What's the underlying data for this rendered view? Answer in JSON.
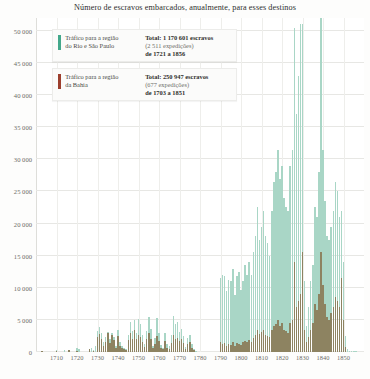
{
  "chart_data": {
    "type": "bar",
    "title": "Número de escravos embarcados, anualmente, para esses destinos",
    "xlabel": "",
    "ylabel": "",
    "ylim": [
      0,
      52000
    ],
    "xlim": [
      1700,
      1860
    ],
    "grid": true,
    "legend_position": "top-left",
    "ytick_labels": [
      "0",
      "5 000",
      "10 000",
      "15 000",
      "20 000",
      "25 000",
      "30 000",
      "35 000",
      "40 000",
      "45 000",
      "50 000"
    ],
    "ytick_values": [
      0,
      5000,
      10000,
      15000,
      20000,
      25000,
      30000,
      35000,
      40000,
      45000,
      50000
    ],
    "xtick_labels": [
      "1710",
      "1720",
      "1730",
      "1740",
      "1750",
      "1760",
      "1770",
      "1780",
      "1790",
      "1800",
      "1810",
      "1820",
      "1830",
      "1840",
      "1850"
    ],
    "xtick_values": [
      1710,
      1720,
      1730,
      1740,
      1750,
      1760,
      1770,
      1780,
      1790,
      1800,
      1810,
      1820,
      1830,
      1840,
      1850
    ],
    "series": [
      {
        "name": "Tráfico para a região do Rio e São Paulo",
        "color": "#a9d6c6",
        "legend_color": "#43a88b",
        "points": [
          [
            1710,
            350
          ],
          [
            1711,
            0
          ],
          [
            1712,
            0
          ],
          [
            1713,
            0
          ],
          [
            1714,
            300
          ],
          [
            1715,
            0
          ],
          [
            1716,
            0
          ],
          [
            1717,
            0
          ],
          [
            1718,
            0
          ],
          [
            1719,
            0
          ],
          [
            1720,
            650
          ],
          [
            1721,
            400
          ],
          [
            1722,
            0
          ],
          [
            1723,
            0
          ],
          [
            1724,
            0
          ],
          [
            1725,
            0
          ],
          [
            1726,
            0
          ],
          [
            1727,
            700
          ],
          [
            1728,
            250
          ],
          [
            1729,
            900
          ],
          [
            1730,
            3200
          ],
          [
            1731,
            3900
          ],
          [
            1732,
            3000
          ],
          [
            1733,
            1500
          ],
          [
            1734,
            2400
          ],
          [
            1735,
            3100
          ],
          [
            1736,
            2000
          ],
          [
            1737,
            3000
          ],
          [
            1738,
            2400
          ],
          [
            1739,
            1000
          ],
          [
            1740,
            3400
          ],
          [
            1741,
            1500
          ],
          [
            1742,
            900
          ],
          [
            1743,
            700
          ],
          [
            1744,
            500
          ],
          [
            1745,
            2700
          ],
          [
            1746,
            4600
          ],
          [
            1747,
            3200
          ],
          [
            1748,
            5000
          ],
          [
            1749,
            2900
          ],
          [
            1750,
            5100
          ],
          [
            1751,
            4400
          ],
          [
            1752,
            2600
          ],
          [
            1753,
            1300
          ],
          [
            1754,
            3300
          ],
          [
            1755,
            5500
          ],
          [
            1756,
            3600
          ],
          [
            1757,
            900
          ],
          [
            1758,
            2200
          ],
          [
            1759,
            5300
          ],
          [
            1760,
            3000
          ],
          [
            1761,
            1100
          ],
          [
            1762,
            600
          ],
          [
            1763,
            3000
          ],
          [
            1764,
            1200
          ],
          [
            1765,
            900
          ],
          [
            1766,
            2600
          ],
          [
            1767,
            5600
          ],
          [
            1768,
            4300
          ],
          [
            1769,
            4700
          ],
          [
            1770,
            3100
          ],
          [
            1771,
            3600
          ],
          [
            1772,
            2500
          ],
          [
            1773,
            800
          ],
          [
            1774,
            2200
          ],
          [
            1775,
            2700
          ],
          [
            1776,
            1200
          ],
          [
            1777,
            400
          ],
          [
            1778,
            200
          ],
          [
            1779,
            0
          ],
          [
            1780,
            0
          ],
          [
            1781,
            0
          ],
          [
            1782,
            0
          ],
          [
            1783,
            0
          ],
          [
            1784,
            0
          ],
          [
            1785,
            0
          ],
          [
            1786,
            0
          ],
          [
            1787,
            0
          ],
          [
            1788,
            0
          ],
          [
            1789,
            0
          ],
          [
            1790,
            11500
          ],
          [
            1791,
            12000
          ],
          [
            1792,
            11800
          ],
          [
            1793,
            9500
          ],
          [
            1794,
            11200
          ],
          [
            1795,
            11000
          ],
          [
            1796,
            13000
          ],
          [
            1797,
            8800
          ],
          [
            1798,
            11800
          ],
          [
            1799,
            12500
          ],
          [
            1800,
            9700
          ],
          [
            1801,
            11000
          ],
          [
            1802,
            13500
          ],
          [
            1803,
            12000
          ],
          [
            1804,
            14000
          ],
          [
            1805,
            12000
          ],
          [
            1806,
            15500
          ],
          [
            1807,
            18000
          ],
          [
            1808,
            22500
          ],
          [
            1809,
            17500
          ],
          [
            1810,
            19500
          ],
          [
            1811,
            22000
          ],
          [
            1812,
            18000
          ],
          [
            1813,
            17000
          ],
          [
            1814,
            15000
          ],
          [
            1815,
            22000
          ],
          [
            1816,
            26500
          ],
          [
            1817,
            28000
          ],
          [
            1818,
            31500
          ],
          [
            1819,
            27000
          ],
          [
            1820,
            29000
          ],
          [
            1821,
            24000
          ],
          [
            1822,
            22500
          ],
          [
            1823,
            22000
          ],
          [
            1824,
            29000
          ],
          [
            1825,
            31500
          ],
          [
            1826,
            50500
          ],
          [
            1827,
            37000
          ],
          [
            1828,
            43000
          ],
          [
            1829,
            51000
          ],
          [
            1830,
            51000
          ],
          [
            1831,
            11000
          ],
          [
            1832,
            4000
          ],
          [
            1833,
            7000
          ],
          [
            1834,
            11000
          ],
          [
            1835,
            13500
          ],
          [
            1836,
            22500
          ],
          [
            1837,
            21000
          ],
          [
            1838,
            28000
          ],
          [
            1839,
            52000
          ],
          [
            1840,
            31500
          ],
          [
            1841,
            23500
          ],
          [
            1842,
            18000
          ],
          [
            1843,
            17500
          ],
          [
            1844,
            19500
          ],
          [
            1845,
            22000
          ],
          [
            1846,
            26500
          ],
          [
            1847,
            25000
          ],
          [
            1848,
            21000
          ],
          [
            1849,
            22000
          ],
          [
            1850,
            14000
          ],
          [
            1851,
            2500
          ],
          [
            1852,
            400
          ],
          [
            1853,
            200
          ],
          [
            1854,
            150
          ],
          [
            1855,
            100
          ],
          [
            1856,
            80
          ]
        ],
        "total_slaves": "1 170 601",
        "expeditions": "2 511",
        "range": "de 1721 a 1856"
      },
      {
        "name": "Tráfico para a região da Bahia",
        "color": "#8d8361",
        "legend_color": "#9c3f2d",
        "points": [
          [
            1703,
            100
          ],
          [
            1710,
            200
          ],
          [
            1716,
            300
          ],
          [
            1720,
            150
          ],
          [
            1726,
            400
          ],
          [
            1728,
            200
          ],
          [
            1730,
            2300
          ],
          [
            1731,
            2800
          ],
          [
            1732,
            2000
          ],
          [
            1733,
            900
          ],
          [
            1734,
            1600
          ],
          [
            1735,
            2900
          ],
          [
            1736,
            1400
          ],
          [
            1737,
            2600
          ],
          [
            1738,
            1800
          ],
          [
            1739,
            700
          ],
          [
            1740,
            2500
          ],
          [
            1741,
            1000
          ],
          [
            1742,
            600
          ],
          [
            1743,
            500
          ],
          [
            1744,
            300
          ],
          [
            1745,
            1800
          ],
          [
            1746,
            3000
          ],
          [
            1747,
            2100
          ],
          [
            1748,
            3400
          ],
          [
            1749,
            2000
          ],
          [
            1750,
            2700
          ],
          [
            1751,
            2300
          ],
          [
            1752,
            1500
          ],
          [
            1753,
            800
          ],
          [
            1754,
            2000
          ],
          [
            1755,
            3000
          ],
          [
            1756,
            2100
          ],
          [
            1757,
            600
          ],
          [
            1758,
            1300
          ],
          [
            1759,
            2500
          ],
          [
            1760,
            1700
          ],
          [
            1761,
            700
          ],
          [
            1762,
            400
          ],
          [
            1763,
            1700
          ],
          [
            1764,
            700
          ],
          [
            1765,
            500
          ],
          [
            1766,
            1400
          ],
          [
            1767,
            2600
          ],
          [
            1768,
            2100
          ],
          [
            1769,
            2200
          ],
          [
            1770,
            1700
          ],
          [
            1771,
            2000
          ],
          [
            1772,
            1400
          ],
          [
            1773,
            500
          ],
          [
            1774,
            1200
          ],
          [
            1775,
            1500
          ],
          [
            1776,
            700
          ],
          [
            1777,
            250
          ],
          [
            1790,
            1500
          ],
          [
            1791,
            1200
          ],
          [
            1792,
            1400
          ],
          [
            1793,
            900
          ],
          [
            1794,
            1300
          ],
          [
            1795,
            1100
          ],
          [
            1796,
            1500
          ],
          [
            1797,
            900
          ],
          [
            1798,
            1400
          ],
          [
            1799,
            1300
          ],
          [
            1800,
            1100
          ],
          [
            1801,
            1500
          ],
          [
            1802,
            1700
          ],
          [
            1803,
            1500
          ],
          [
            1804,
            1900
          ],
          [
            1805,
            1500
          ],
          [
            1806,
            2200
          ],
          [
            1807,
            2700
          ],
          [
            1808,
            3500
          ],
          [
            1809,
            2800
          ],
          [
            1810,
            3100
          ],
          [
            1811,
            3400
          ],
          [
            1812,
            2700
          ],
          [
            1813,
            2500
          ],
          [
            1814,
            2300
          ],
          [
            1815,
            3400
          ],
          [
            1816,
            4000
          ],
          [
            1817,
            4300
          ],
          [
            1818,
            5000
          ],
          [
            1819,
            4000
          ],
          [
            1820,
            4500
          ],
          [
            1821,
            3500
          ],
          [
            1822,
            3300
          ],
          [
            1823,
            3000
          ],
          [
            1824,
            4500
          ],
          [
            1825,
            5000
          ],
          [
            1826,
            14000
          ],
          [
            1827,
            7000
          ],
          [
            1828,
            8000
          ],
          [
            1829,
            9000
          ],
          [
            1830,
            15500
          ],
          [
            1831,
            3500
          ],
          [
            1832,
            1500
          ],
          [
            1833,
            2300
          ],
          [
            1834,
            3500
          ],
          [
            1835,
            4500
          ],
          [
            1836,
            7500
          ],
          [
            1837,
            6500
          ],
          [
            1838,
            9000
          ],
          [
            1839,
            15500
          ],
          [
            1840,
            10500
          ],
          [
            1841,
            7500
          ],
          [
            1842,
            5500
          ],
          [
            1843,
            5000
          ],
          [
            1844,
            6000
          ],
          [
            1845,
            7000
          ],
          [
            1846,
            8500
          ],
          [
            1847,
            8000
          ],
          [
            1848,
            7000
          ],
          [
            1849,
            11500
          ],
          [
            1850,
            5000
          ],
          [
            1851,
            800
          ]
        ],
        "total_slaves": "250 947",
        "expeditions": "677",
        "range": "de 1703 a 1851"
      }
    ]
  },
  "legend": {
    "rio": {
      "label_line1": "Tráfico para a região",
      "label_line2": "do Rio e São Paulo",
      "stats_line1": "Total: 1 170 601 escravos",
      "stats_line2": "(2 511 expedições)",
      "stats_line3": "de 1721 a 1856"
    },
    "bahia": {
      "label_line1": "Tráfico para a região",
      "label_line2": "da Bahia",
      "stats_line1": "Total: 250 947 escravos",
      "stats_line2": "(677 expedições)",
      "stats_line3": "de 1703 a 1851"
    }
  }
}
